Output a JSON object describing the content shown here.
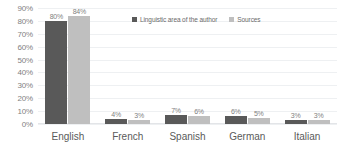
{
  "chart_data": {
    "type": "bar",
    "title": "",
    "xlabel": "",
    "ylabel": "",
    "categories": [
      "English",
      "French",
      "Spanish",
      "German",
      "Italian"
    ],
    "series": [
      {
        "name": "Linguistic area of the author",
        "color": "#595959",
        "values": [
          80,
          4,
          7,
          6,
          3
        ],
        "labels": [
          "80%",
          "4%",
          "7%",
          "6%",
          "3%"
        ]
      },
      {
        "name": "Sources",
        "color": "#bfbfbf",
        "values": [
          84,
          3,
          6,
          5,
          3
        ],
        "labels": [
          "84%",
          "3%",
          "6%",
          "5%",
          "3%"
        ]
      }
    ],
    "ylim": [
      0,
      90
    ],
    "ytick_values": [
      90,
      80,
      70,
      60,
      50,
      40,
      30,
      20,
      10,
      0
    ],
    "yticks": [
      "90%",
      "80%",
      "70%",
      "60%",
      "50%",
      "40%",
      "30%",
      "20%",
      "10%",
      "0%"
    ],
    "grid": true,
    "legend_position": "top-center"
  }
}
